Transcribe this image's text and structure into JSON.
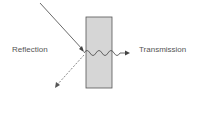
{
  "diagram": {
    "labels": {
      "reflection": "Reflection",
      "transmission": "Transmission"
    },
    "colors": {
      "medium_fill": "#d6d6d6",
      "medium_stroke": "#555555",
      "ray": "#444444"
    }
  }
}
